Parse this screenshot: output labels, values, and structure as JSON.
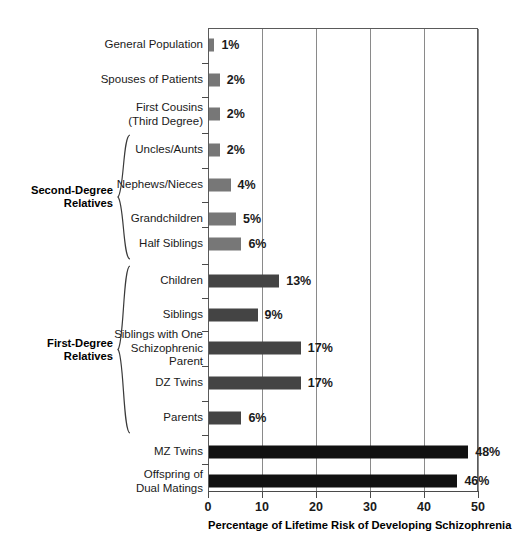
{
  "chart_data": {
    "type": "bar",
    "orientation": "horizontal",
    "title": "",
    "xlabel": "Percentage of Lifetime Risk of Developing Schizophrenia",
    "ylabel": "",
    "xlim": [
      0,
      50
    ],
    "xticks": [
      0,
      10,
      20,
      30,
      40,
      50
    ],
    "grid": true,
    "legend": "none",
    "categories": [
      "General Population",
      "Spouses of Patients",
      "First Cousins\n(Third Degree)",
      "Uncles/Aunts",
      "Nephews/Nieces",
      "Grandchildren",
      "Half Siblings",
      "Children",
      "Siblings",
      "Siblings with One\nSchizophrenic\nParent",
      "DZ Twins",
      "Parents",
      "MZ Twins",
      "Offspring of\nDual Matings"
    ],
    "values": [
      1,
      2,
      2,
      2,
      4,
      5,
      6,
      13,
      9,
      17,
      17,
      6,
      48,
      46
    ],
    "value_labels": [
      "1%",
      "2%",
      "2%",
      "2%",
      "4%",
      "5%",
      "6%",
      "13%",
      "9%",
      "17%",
      "17%",
      "6%",
      "48%",
      "46%"
    ],
    "bar_colors": [
      "#777777",
      "#777777",
      "#777777",
      "#777777",
      "#777777",
      "#777777",
      "#777777",
      "#444444",
      "#444444",
      "#444444",
      "#444444",
      "#444444",
      "#111111",
      "#111111"
    ],
    "groups": [
      {
        "label": "Second-Degree\nRelatives",
        "from": 3,
        "to": 6
      },
      {
        "label": "First-Degree\nRelatives",
        "from": 7,
        "to": 11
      }
    ],
    "colors": {
      "second_degree": "#777777",
      "first_degree": "#444444",
      "highest_risk": "#111111",
      "axis": "#4a4a4a",
      "gridline": "#8a8a8a",
      "text": "#1a1a1a",
      "background": "#ffffff"
    }
  }
}
